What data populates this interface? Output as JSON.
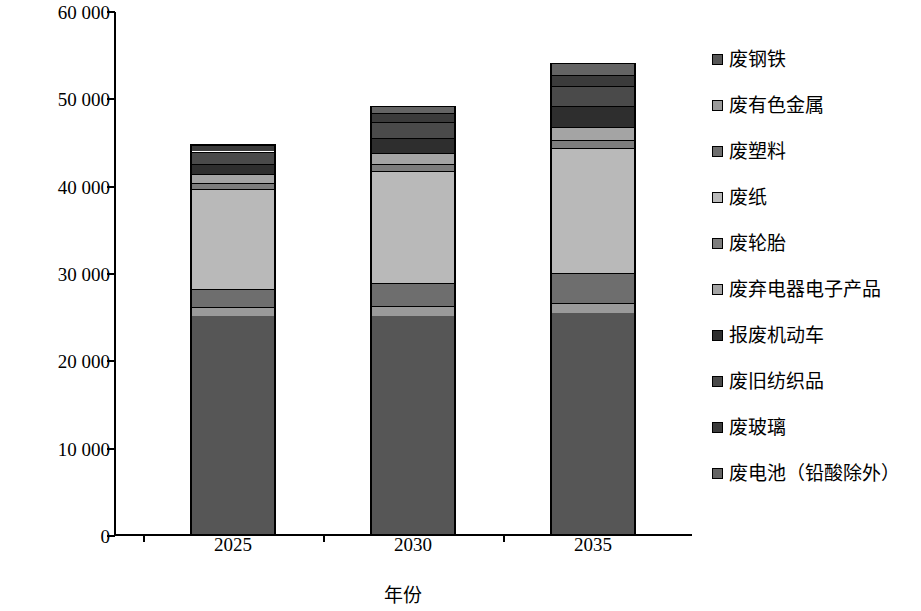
{
  "chart_data": {
    "type": "bar",
    "subtype": "stacked-bar",
    "title": "",
    "xlabel": "年份",
    "ylabel": "再生资源量/万 t",
    "categories": [
      "2025",
      "2030",
      "2035"
    ],
    "ylim": [
      0,
      60000
    ],
    "y_ticks": [
      0,
      10000,
      20000,
      30000,
      40000,
      50000,
      60000
    ],
    "y_tick_labels": [
      "0",
      "10 000",
      "20 000",
      "30 000",
      "40 000",
      "50 000",
      "60 000"
    ],
    "grid": false,
    "legend_position": "right",
    "totals": [
      44700,
      49000,
      53900
    ],
    "series": [
      {
        "name": "废钢铁",
        "values": [
          25000,
          25000,
          25300
        ],
        "color": "#565656"
      },
      {
        "name": "废有色金属",
        "values": [
          1000,
          1100,
          1200
        ],
        "color": "#9a9a9a"
      },
      {
        "name": "废塑料",
        "values": [
          2100,
          2600,
          3400
        ],
        "color": "#6e6e6e"
      },
      {
        "name": "废纸",
        "values": [
          11400,
          12900,
          14300
        ],
        "color": "#b9b9b9"
      },
      {
        "name": "废轮胎",
        "values": [
          700,
          800,
          900
        ],
        "color": "#7d7d7d"
      },
      {
        "name": "废弃电器电子产品",
        "values": [
          1000,
          1200,
          1500
        ],
        "color": "#a4a4a4"
      },
      {
        "name": "报废机动车",
        "values": [
          1200,
          1800,
          2400
        ],
        "color": "#2e2e2e"
      },
      {
        "name": "废旧纺织品",
        "values": [
          1400,
          1800,
          2300
        ],
        "color": "#4a4a4a"
      },
      {
        "name": "废玻璃",
        "values": [
          800,
          1000,
          1300
        ],
        "color": "#3b3b3b"
      },
      {
        "name": "废电池（铅酸除外）",
        "values": [
          100,
          800,
          1300
        ],
        "color": "#646464"
      }
    ]
  },
  "axis": {
    "y_title": "再生资源量/万 t",
    "x_title": "年份"
  },
  "legend": {
    "items": [
      {
        "label": "废钢铁"
      },
      {
        "label": "废有色金属"
      },
      {
        "label": "废塑料"
      },
      {
        "label": "废纸"
      },
      {
        "label": "废轮胎"
      },
      {
        "label": "废弃电器电子产品"
      },
      {
        "label": "报废机动车"
      },
      {
        "label": "废旧纺织品"
      },
      {
        "label": "废玻璃"
      },
      {
        "label": "废电池（铅酸除外）"
      }
    ]
  }
}
